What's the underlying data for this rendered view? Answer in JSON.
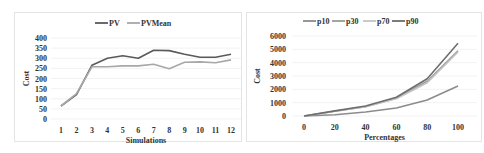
{
  "chart_data": [
    {
      "type": "line",
      "title": "",
      "xlabel": "Simulations",
      "ylabel": "Cost",
      "x": [
        1,
        2,
        3,
        4,
        5,
        6,
        7,
        8,
        9,
        10,
        11,
        12
      ],
      "x_tick_labels": [
        "1",
        "2",
        "3",
        "4",
        "5",
        "6",
        "7",
        "8",
        "9",
        "10",
        "11",
        "12"
      ],
      "y_tick_labels": [
        "0",
        "50",
        "100",
        "150",
        "200",
        "250",
        "300",
        "350",
        "400"
      ],
      "ylim": [
        0,
        400
      ],
      "grid": true,
      "legend_position": "top",
      "series": [
        {
          "name": "PV",
          "color": "#5a5a5a",
          "values": [
            64,
            120,
            265,
            300,
            312,
            300,
            340,
            338,
            320,
            305,
            305,
            320
          ]
        },
        {
          "name": "PVMean",
          "color": "#a8a8a8",
          "values": [
            64,
            125,
            258,
            258,
            262,
            262,
            270,
            248,
            280,
            282,
            278,
            292
          ]
        }
      ]
    },
    {
      "type": "line",
      "title": "",
      "xlabel": "Percentages",
      "ylabel": "Cost",
      "x": [
        0,
        20,
        40,
        60,
        80,
        100
      ],
      "x_tick_labels": [
        "0",
        "20",
        "40",
        "60",
        "80",
        "100"
      ],
      "y_tick_labels": [
        "0",
        "1000",
        "2000",
        "3000",
        "4000",
        "5000",
        "6000"
      ],
      "ylim": [
        0,
        6000
      ],
      "grid": true,
      "legend_position": "top",
      "series": [
        {
          "name": "p10",
          "color": "#8c8c8c",
          "values": [
            0,
            100,
            300,
            600,
            1200,
            2250
          ]
        },
        {
          "name": "p30",
          "color": "#9a9a9a",
          "values": [
            0,
            350,
            700,
            1350,
            2600,
            4900
          ]
        },
        {
          "name": "p70",
          "color": "#c4c4c4",
          "values": [
            0,
            350,
            700,
            1300,
            2500,
            4800
          ]
        },
        {
          "name": "p90",
          "color": "#6e6e6e",
          "values": [
            0,
            380,
            750,
            1400,
            2800,
            5450
          ]
        }
      ]
    }
  ]
}
